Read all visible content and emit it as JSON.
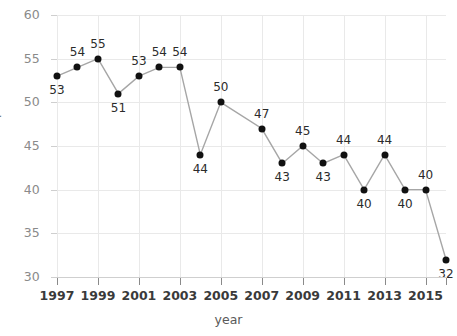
{
  "chart_data": {
    "type": "line",
    "title": "",
    "xlabel": "year",
    "ylabel": "percent",
    "xlim": [
      1997,
      2016
    ],
    "ylim": [
      30,
      60
    ],
    "yticks": [
      30,
      35,
      40,
      45,
      50,
      55,
      60
    ],
    "xticks": [
      1997,
      1999,
      2001,
      2003,
      2005,
      2007,
      2009,
      2011,
      2013,
      2015
    ],
    "xtick_labels": [
      "1997",
      "1999",
      "2001",
      "2003",
      "2005",
      "2007",
      "2009",
      "2011",
      "2013",
      "2015"
    ],
    "grid": true,
    "legend": "none",
    "marker_color": "#111111",
    "line_color": "#a6a6a6",
    "grid_color": "#e9e9e9",
    "x": [
      1997,
      1998,
      1999,
      2000,
      2001,
      2002,
      2003,
      2004,
      2005,
      2007,
      2008,
      2009,
      2010,
      2011,
      2012,
      2013,
      2014,
      2015,
      2016
    ],
    "values": [
      53,
      54,
      55,
      51,
      53,
      54,
      54,
      44,
      50,
      47,
      43,
      45,
      43,
      44,
      40,
      44,
      40,
      40,
      32
    ],
    "point_labels": [
      "53",
      "54",
      "55",
      "51",
      "53",
      "54",
      "54",
      "44",
      "50",
      "47",
      "43",
      "45",
      "43",
      "44",
      "40",
      "44",
      "40",
      "40",
      "32"
    ],
    "label_positions": [
      "below",
      "above",
      "above",
      "below",
      "above",
      "above",
      "above",
      "below",
      "above",
      "above",
      "below",
      "above",
      "below",
      "above",
      "below",
      "above",
      "below",
      "above",
      "below"
    ]
  }
}
